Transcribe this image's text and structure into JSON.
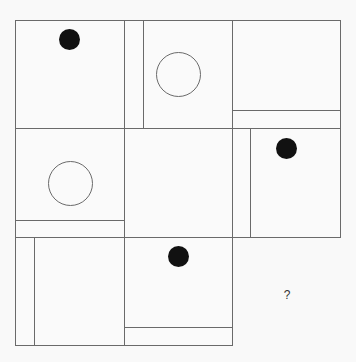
{
  "puzzle": {
    "type": "3x3 matrix reasoning",
    "missing_label": "?",
    "colors": {
      "line": "#6a6a6a",
      "dot": "#111111",
      "background": "#fafafa"
    },
    "cells": [
      {
        "row": 1,
        "col": 1,
        "shape": "filled-dot",
        "position": "top-center",
        "divider": "none"
      },
      {
        "row": 1,
        "col": 2,
        "shape": "hollow-circle",
        "position": "center",
        "divider": "vertical-left"
      },
      {
        "row": 1,
        "col": 3,
        "shape": "none",
        "position": "",
        "divider": "horizontal-bottom"
      },
      {
        "row": 2,
        "col": 1,
        "shape": "hollow-circle",
        "position": "center",
        "divider": "horizontal-bottom"
      },
      {
        "row": 2,
        "col": 2,
        "shape": "none",
        "position": "",
        "divider": "none"
      },
      {
        "row": 2,
        "col": 3,
        "shape": "filled-dot",
        "position": "top-center",
        "divider": "vertical-left"
      },
      {
        "row": 3,
        "col": 1,
        "shape": "none",
        "position": "",
        "divider": "vertical-left"
      },
      {
        "row": 3,
        "col": 2,
        "shape": "filled-dot",
        "position": "top-center",
        "divider": "horizontal-bottom"
      },
      {
        "row": 3,
        "col": 3,
        "shape": "question-mark",
        "position": "center",
        "divider": "none"
      }
    ]
  }
}
